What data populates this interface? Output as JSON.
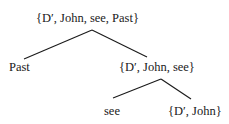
{
  "tree": {
    "root": {
      "label": "{D′, John, see, Past}"
    },
    "level1": {
      "left": {
        "label": "Past"
      },
      "right": {
        "label": "{D′, John, see}"
      }
    },
    "level2": {
      "left": {
        "label": "see"
      },
      "right": {
        "label": "{D′, John}"
      }
    }
  }
}
